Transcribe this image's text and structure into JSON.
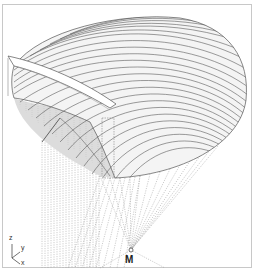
{
  "diagram": {
    "point_label": "M",
    "axes": {
      "z": "z",
      "y": "y",
      "x": "x"
    },
    "colors": {
      "frame": "#c8c8c8",
      "ribs": "#555555",
      "shell_fill": "#f4f4f4",
      "underside_fill": "#dcdcdc",
      "projection_lines": "#9a9a9a"
    }
  }
}
